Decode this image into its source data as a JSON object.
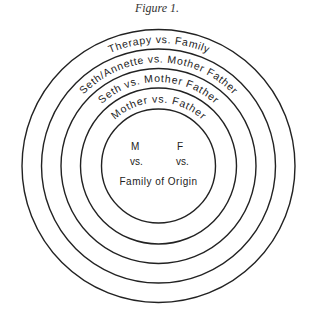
{
  "caption": "Figure 1.",
  "rings": [
    {
      "label": "Therapy vs. Family"
    },
    {
      "label": "Seth/Annette vs. Mother Father"
    },
    {
      "label": "Seth vs. Mother Father"
    },
    {
      "label": "Mother vs. Father"
    }
  ],
  "center": {
    "m": "M",
    "f": "F",
    "vs_left": "vs.",
    "vs_right": "vs.",
    "bottom": "Family of Origin"
  }
}
